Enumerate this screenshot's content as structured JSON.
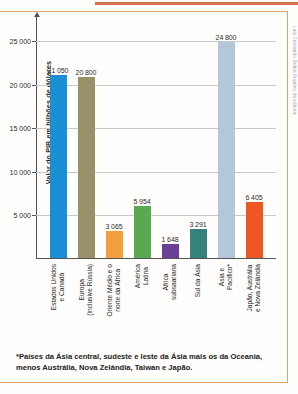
{
  "chart_data": {
    "type": "bar",
    "title": "",
    "xlabel": "",
    "ylabel": "Valor do PIB em bilhões de dólares",
    "ylim": [
      0,
      27000
    ],
    "grid": true,
    "legend": "none",
    "yticks": [
      "5 000",
      "10 000",
      "15 000",
      "20 000",
      "25 000"
    ],
    "ytick_values": [
      5000,
      10000,
      15000,
      20000,
      25000
    ],
    "categories": [
      "Estados Unidos\ne Canadá",
      "Europa\n(inclusive Rússia)",
      "Oriente Médio e o\nnorte da África",
      "América\nLatina",
      "África\nsubsaariana",
      "Sul da Ásia",
      "Ásia e\nPacífico*",
      "Japão, Austrália\ne Nova Zelândia"
    ],
    "values": [
      21050,
      20800,
      3065,
      5954,
      1648,
      3291,
      24800,
      6405
    ],
    "value_labels": [
      "21 050",
      "20 800",
      "3 065",
      "5 954",
      "1 648",
      "3 291",
      "24 800",
      "6 405"
    ],
    "colors": [
      "#1b8fd4",
      "#9a9168",
      "#f2a03c",
      "#5aa84f",
      "#6b3f93",
      "#36827c",
      "#b4c6d9",
      "#ee5622"
    ]
  },
  "footnote": {
    "text": "*Países da Ásia central, sudeste e leste da Ásia mais os da Oceania, menos Austrália, Nova Zelândia, Taiwan e Japão."
  },
  "credit": {
    "text": "Luiz Fernando Rubio/Arquivo da editora"
  }
}
